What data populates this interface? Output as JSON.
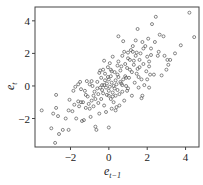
{
  "chart_data": {
    "type": "scatter",
    "title": "",
    "xlabel": "e_{t-1}",
    "ylabel": "e_t",
    "xlabel_main": "e",
    "xlabel_sub": "t−1",
    "ylabel_main": "e",
    "ylabel_sub": "t",
    "xlim": [
      -3.85,
      4.7
    ],
    "ylim": [
      -3.75,
      4.85
    ],
    "xticks": [
      -2,
      0,
      2,
      4
    ],
    "yticks": [
      -2,
      0,
      2,
      4
    ],
    "xtick_labels": [
      "−2",
      "0",
      "2",
      "4"
    ],
    "ytick_labels": [
      "−2",
      "0",
      "2",
      "4"
    ],
    "grid": false,
    "legend": null,
    "marker": "open-circle",
    "points": [
      [
        -3.5,
        -1.5
      ],
      [
        -3.0,
        -2.6
      ],
      [
        -2.9,
        -1.7
      ],
      [
        -2.75,
        -1.35
      ],
      [
        -2.75,
        -0.55
      ],
      [
        -2.8,
        -3.5
      ],
      [
        -2.6,
        -2.95
      ],
      [
        -2.65,
        -1.85
      ],
      [
        -2.4,
        -2.7
      ],
      [
        -2.25,
        -2.0
      ],
      [
        -2.1,
        -2.7
      ],
      [
        -2.05,
        -0.85
      ],
      [
        -1.9,
        -1.55
      ],
      [
        -1.85,
        -0.3
      ],
      [
        -1.8,
        -1.15
      ],
      [
        -1.7,
        -2.0
      ],
      [
        -1.6,
        -0.95
      ],
      [
        -1.55,
        -1.25
      ],
      [
        -1.5,
        0.25
      ],
      [
        -1.45,
        -0.2
      ],
      [
        -1.4,
        -2.15
      ],
      [
        -1.35,
        -1.0
      ],
      [
        -1.3,
        -2.1
      ],
      [
        -1.25,
        -0.3
      ],
      [
        -1.2,
        -1.35
      ],
      [
        -1.15,
        0.3
      ],
      [
        -1.1,
        -0.65
      ],
      [
        -1.05,
        -1.1
      ],
      [
        -1.0,
        0.1
      ],
      [
        -0.95,
        -1.9
      ],
      [
        -0.9,
        -0.9
      ],
      [
        -0.85,
        0.0
      ],
      [
        -0.8,
        -1.25
      ],
      [
        -0.75,
        -0.35
      ],
      [
        -0.7,
        -0.8
      ],
      [
        -0.7,
        -2.5
      ],
      [
        -0.65,
        -2.7
      ],
      [
        -0.6,
        0.25
      ],
      [
        -0.55,
        -0.5
      ],
      [
        -0.5,
        -1.7
      ],
      [
        -0.5,
        0.8
      ],
      [
        -0.45,
        -0.1
      ],
      [
        -0.4,
        -0.8
      ],
      [
        -0.4,
        0.5
      ],
      [
        -0.35,
        0.05
      ],
      [
        -0.3,
        -0.45
      ],
      [
        -0.3,
        1.0
      ],
      [
        -0.25,
        -1.2
      ],
      [
        -0.2,
        0.35
      ],
      [
        -0.2,
        0.75
      ],
      [
        -0.15,
        -0.1
      ],
      [
        -0.1,
        -0.55
      ],
      [
        -0.1,
        0.15
      ],
      [
        -0.05,
        1.15
      ],
      [
        0.0,
        -0.3
      ],
      [
        0.0,
        0.4
      ],
      [
        0.0,
        -2.55
      ],
      [
        0.05,
        -0.05
      ],
      [
        0.05,
        1.4
      ],
      [
        0.1,
        -0.8
      ],
      [
        0.1,
        0.6
      ],
      [
        0.15,
        -1.4
      ],
      [
        0.15,
        0.2
      ],
      [
        0.2,
        -0.4
      ],
      [
        0.2,
        1.8
      ],
      [
        0.25,
        0.0
      ],
      [
        0.25,
        -1.0
      ],
      [
        0.3,
        0.85
      ],
      [
        0.35,
        -0.6
      ],
      [
        0.35,
        0.35
      ],
      [
        0.4,
        -1.3
      ],
      [
        0.4,
        0.1
      ],
      [
        0.45,
        1.25
      ],
      [
        0.45,
        -0.25
      ],
      [
        0.5,
        0.55
      ],
      [
        0.5,
        3.05
      ],
      [
        0.55,
        -0.5
      ],
      [
        0.55,
        -1.2
      ],
      [
        0.6,
        0.95
      ],
      [
        0.65,
        0.15
      ],
      [
        0.7,
        -0.35
      ],
      [
        0.7,
        1.85
      ],
      [
        0.75,
        0.4
      ],
      [
        0.75,
        2.75
      ],
      [
        0.8,
        -0.9
      ],
      [
        0.85,
        0.6
      ],
      [
        0.85,
        1.35
      ],
      [
        0.9,
        0.0
      ],
      [
        0.95,
        1.1
      ],
      [
        1.0,
        2.05
      ],
      [
        1.0,
        -0.15
      ],
      [
        1.05,
        0.5
      ],
      [
        1.1,
        1.6
      ],
      [
        1.15,
        2.2
      ],
      [
        1.2,
        0.85
      ],
      [
        1.2,
        -0.6
      ],
      [
        1.25,
        2.1
      ],
      [
        1.3,
        1.3
      ],
      [
        1.35,
        0.2
      ],
      [
        1.4,
        1.85
      ],
      [
        1.4,
        2.8
      ],
      [
        1.45,
        0.75
      ],
      [
        1.5,
        3.5
      ],
      [
        1.5,
        1.05
      ],
      [
        1.55,
        -0.1
      ],
      [
        1.6,
        1.6
      ],
      [
        1.65,
        2.0
      ],
      [
        1.7,
        0.4
      ],
      [
        1.75,
        2.7
      ],
      [
        1.75,
        -0.6
      ],
      [
        1.8,
        1.35
      ],
      [
        1.85,
        0.05
      ],
      [
        1.9,
        2.45
      ],
      [
        1.95,
        0.9
      ],
      [
        2.0,
        1.8
      ],
      [
        2.05,
        2.9
      ],
      [
        2.1,
        1.2
      ],
      [
        2.15,
        0.7
      ],
      [
        2.2,
        1.9
      ],
      [
        2.25,
        3.8
      ],
      [
        2.35,
        0.7
      ],
      [
        2.4,
        2.7
      ],
      [
        2.45,
        4.25
      ],
      [
        2.55,
        1.85
      ],
      [
        2.65,
        3.15
      ],
      [
        2.75,
        0.65
      ],
      [
        2.85,
        3.05
      ],
      [
        2.9,
        1.85
      ],
      [
        3.0,
        1.0
      ],
      [
        3.05,
        1.6
      ],
      [
        3.1,
        1.3
      ],
      [
        3.2,
        1.6
      ],
      [
        3.45,
        2.0
      ],
      [
        3.75,
        2.5
      ],
      [
        4.2,
        4.5
      ],
      [
        4.45,
        3.0
      ],
      [
        -1.6,
        0.1
      ],
      [
        -0.6,
        -0.15
      ],
      [
        -0.25,
        0.05
      ],
      [
        0.0,
        -0.6
      ],
      [
        0.3,
        -0.15
      ],
      [
        0.6,
        0.25
      ],
      [
        0.9,
        0.5
      ],
      [
        1.1,
        1.0
      ],
      [
        1.3,
        1.55
      ],
      [
        -0.05,
        0.55
      ],
      [
        0.15,
        0.9
      ],
      [
        0.45,
        0.7
      ],
      [
        0.65,
        1.2
      ],
      [
        1.6,
        1.15
      ],
      [
        1.0,
        1.7
      ],
      [
        1.45,
        2.05
      ],
      [
        1.8,
        2.3
      ],
      [
        2.1,
        1.5
      ],
      [
        2.2,
        2.3
      ],
      [
        -0.8,
        -0.6
      ],
      [
        -0.55,
        -1.05
      ],
      [
        -1.2,
        -0.55
      ],
      [
        -0.35,
        -0.25
      ],
      [
        0.2,
        -0.65
      ],
      [
        -1.0,
        -1.4
      ],
      [
        -1.45,
        -1.0
      ],
      [
        -0.15,
        -1.6
      ],
      [
        0.35,
        -1.5
      ],
      [
        -2.1,
        -1.5
      ],
      [
        1.7,
        -0.75
      ],
      [
        2.1,
        -0.1
      ],
      [
        -0.9,
        0.3
      ],
      [
        -0.25,
        1.55
      ],
      [
        0.1,
        1.0
      ],
      [
        0.8,
        2.1
      ],
      [
        1.25,
        2.45
      ],
      [
        0.5,
        1.5
      ],
      [
        2.6,
        2.1
      ],
      [
        2.0,
        0.4
      ],
      [
        -1.75,
        -0.05
      ],
      [
        -0.45,
        0.95
      ],
      [
        0.95,
        -0.3
      ],
      [
        1.55,
        0.55
      ],
      [
        0.7,
        0.05
      ]
    ]
  }
}
